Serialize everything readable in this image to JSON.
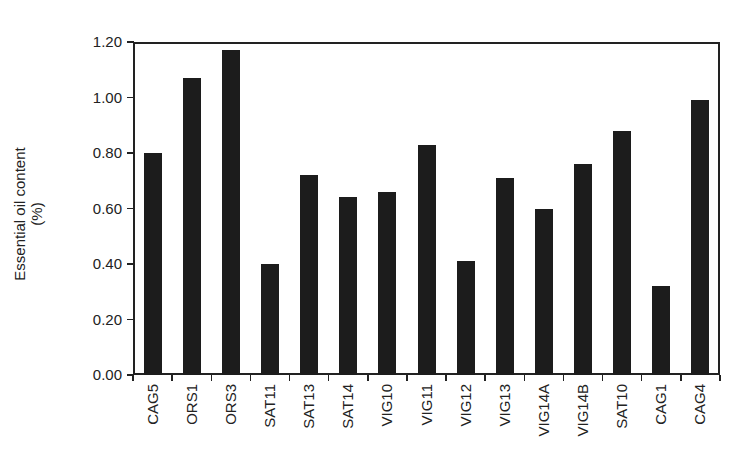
{
  "chart_data": {
    "type": "bar",
    "title": "",
    "xlabel": "",
    "ylabel": "Essential oil content (%)",
    "ylabel_lines": [
      "Essential oil content",
      "(%)"
    ],
    "ylim": [
      0,
      1.2
    ],
    "yticks": [
      "0.00",
      "0.20",
      "0.40",
      "0.60",
      "0.80",
      "1.00",
      "1.20"
    ],
    "grid": false,
    "legend": null,
    "categories": [
      "CAG5",
      "ORS1",
      "ORS3",
      "SAT11",
      "SAT13",
      "SAT14",
      "VIG10",
      "VIG11",
      "VIG12",
      "VIG13",
      "VIG14A",
      "VIG14B",
      "SAT10",
      "CAG1",
      "CAG4"
    ],
    "values": [
      0.8,
      1.07,
      1.17,
      0.4,
      0.72,
      0.64,
      0.66,
      0.83,
      0.41,
      0.71,
      0.6,
      0.76,
      0.88,
      0.32,
      0.99
    ],
    "bar_color": "#1c1c1c"
  }
}
